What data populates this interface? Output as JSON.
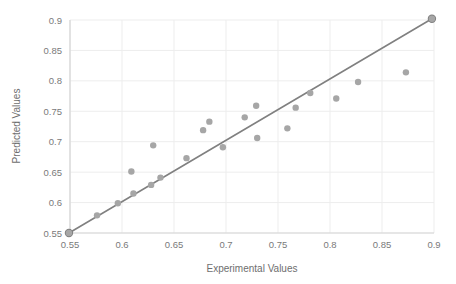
{
  "chart_data": {
    "type": "scatter",
    "title": "",
    "xlabel": "Experimental Values",
    "ylabel": "Predicted Values",
    "xlim": [
      0.55,
      0.9
    ],
    "ylim": [
      0.55,
      0.9
    ],
    "xticks": [
      "0.55",
      "0.6",
      "0.65",
      "0.7",
      "0.75",
      "0.8",
      "0.85",
      "0.9"
    ],
    "yticks": [
      "0.55",
      "0.6",
      "0.65",
      "0.7",
      "0.75",
      "0.8",
      "0.85",
      "0.9"
    ],
    "xtick_values": [
      0.55,
      0.6,
      0.65,
      0.7,
      0.75,
      0.8,
      0.85,
      0.9
    ],
    "ytick_values": [
      0.55,
      0.6,
      0.65,
      0.7,
      0.75,
      0.8,
      0.85,
      0.9
    ],
    "grid": true,
    "grid_color": "#ededed",
    "axis_color": "#d6d6d6",
    "legend": false,
    "legend_position": "none",
    "marker_color": "#a6a6a6",
    "marker_radius": 3.2,
    "series": [
      {
        "name": "Predicted vs Experimental",
        "marker": "circle",
        "points": [
          {
            "x": 0.549,
            "y": 0.55
          },
          {
            "x": 0.576,
            "y": 0.579
          },
          {
            "x": 0.596,
            "y": 0.599
          },
          {
            "x": 0.609,
            "y": 0.651
          },
          {
            "x": 0.611,
            "y": 0.615
          },
          {
            "x": 0.628,
            "y": 0.629
          },
          {
            "x": 0.63,
            "y": 0.694
          },
          {
            "x": 0.637,
            "y": 0.641
          },
          {
            "x": 0.662,
            "y": 0.673
          },
          {
            "x": 0.678,
            "y": 0.719
          },
          {
            "x": 0.684,
            "y": 0.733
          },
          {
            "x": 0.697,
            "y": 0.691
          },
          {
            "x": 0.718,
            "y": 0.74
          },
          {
            "x": 0.729,
            "y": 0.759
          },
          {
            "x": 0.73,
            "y": 0.706
          },
          {
            "x": 0.759,
            "y": 0.722
          },
          {
            "x": 0.767,
            "y": 0.756
          },
          {
            "x": 0.781,
            "y": 0.78
          },
          {
            "x": 0.806,
            "y": 0.771
          },
          {
            "x": 0.827,
            "y": 0.798
          },
          {
            "x": 0.873,
            "y": 0.814
          },
          {
            "x": 0.898,
            "y": 0.902
          }
        ]
      }
    ],
    "reference_line": {
      "name": "identity-line",
      "color": "#808080",
      "width": 1.6,
      "x0": 0.549,
      "y0": 0.55,
      "x1": 0.898,
      "y1": 0.902,
      "endpoint_marker_radius": 4.2
    }
  }
}
